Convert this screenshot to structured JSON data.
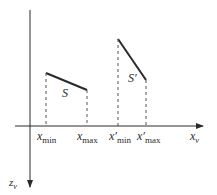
{
  "diagram": {
    "axes": {
      "horizontal_label": "x",
      "horizontal_sub": "v",
      "vertical_label": "z",
      "vertical_sub": "v"
    },
    "segments": [
      {
        "name": "S",
        "label": "S",
        "xmin_label": "x",
        "xmin_sub": "min",
        "xmax_label": "x",
        "xmax_sub": "max"
      },
      {
        "name": "S-prime",
        "label": "S′",
        "xmin_label": "x′",
        "xmin_sub": "min",
        "xmax_label": "x′",
        "xmax_sub": "max"
      }
    ],
    "colors": {
      "ink": "#2a2a2a",
      "dash": "#555555"
    }
  }
}
